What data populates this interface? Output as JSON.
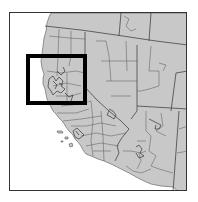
{
  "map": {
    "region": "Western United States (California, Nevada, Arizona)",
    "features": "county boundaries",
    "colors": {
      "land": "#c8c8c8",
      "water": "#ffffff",
      "boundary": "#4a4a4a",
      "highlight": "#000000",
      "frame": "#333333"
    },
    "highlight_box": {
      "label": "San Francisco Bay Area",
      "x": 25,
      "y": 53,
      "width": 61,
      "height": 51,
      "stroke_width": 4
    }
  }
}
